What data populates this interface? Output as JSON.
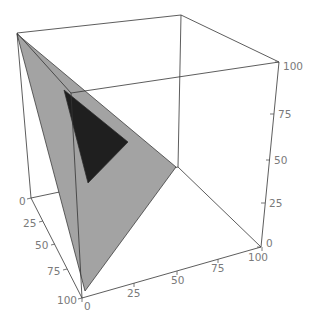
{
  "chart_data": {
    "type": "polygon3d",
    "title": "",
    "axes": {
      "left_edge": {
        "label": "",
        "ticks": [
          "0",
          "25",
          "50",
          "75",
          "100"
        ],
        "range": [
          0,
          100
        ]
      },
      "bottom_edge": {
        "label": "",
        "ticks": [
          "0",
          "25",
          "50",
          "75",
          "100"
        ],
        "range": [
          0,
          100
        ]
      },
      "vertical": {
        "label": "",
        "ticks": [
          "0",
          "25",
          "50",
          "75",
          "100"
        ],
        "range": [
          0,
          100
        ]
      }
    },
    "grid": false,
    "legend": null,
    "polygons": [
      {
        "name": "gray-plane",
        "color": "#a3a3a3",
        "vertices_data": [
          [
            0,
            0,
            100
          ],
          [
            100,
            0,
            0
          ],
          [
            0,
            100,
            0
          ]
        ],
        "vertices_screen": [
          [
            17,
            34
          ],
          [
            85,
            291
          ],
          [
            176,
            167
          ]
        ]
      },
      {
        "name": "dark-triangle",
        "color": "#1f1f1f",
        "vertices_screen": [
          [
            64,
            90
          ],
          [
            128,
            142
          ],
          [
            88,
            183
          ]
        ]
      }
    ],
    "box": {
      "back_edges": [
        [
          [
            181,
            15
          ],
          [
            178,
            167
          ]
        ],
        [
          [
            178,
            167
          ],
          [
            31,
            198
          ]
        ],
        [
          [
            178,
            167
          ],
          [
            261,
            247
          ]
        ]
      ],
      "front_edges": [
        [
          [
            17,
            33
          ],
          [
            181,
            15
          ]
        ],
        [
          [
            181,
            15
          ],
          [
            279,
            62
          ]
        ],
        [
          [
            17,
            33
          ],
          [
            31,
            198
          ]
        ],
        [
          [
            31,
            198
          ],
          [
            82,
            298
          ]
        ],
        [
          [
            82,
            298
          ],
          [
            261,
            247
          ]
        ],
        [
          [
            261,
            247
          ],
          [
            279,
            62
          ]
        ],
        [
          [
            17,
            33
          ],
          [
            71,
            93
          ]
        ],
        [
          [
            71,
            93
          ],
          [
            279,
            62
          ]
        ],
        [
          [
            71,
            93
          ],
          [
            82,
            298
          ]
        ]
      ]
    },
    "tick_marks": {
      "left_edge": [
        {
          "label": "0",
          "at": [
            31,
            198
          ],
          "dir": [
            -4,
            1
          ],
          "text_at": [
            19,
            205
          ]
        },
        {
          "label": "25",
          "at": [
            43,
            221
          ],
          "dir": [
            -4,
            1
          ],
          "text_at": [
            23,
            227
          ]
        },
        {
          "label": "50",
          "at": [
            55,
            244
          ],
          "dir": [
            -4,
            1
          ],
          "text_at": [
            35,
            249
          ]
        },
        {
          "label": "75",
          "at": [
            67,
            269
          ],
          "dir": [
            -4,
            1
          ],
          "text_at": [
            47,
            275
          ]
        },
        {
          "label": "100",
          "at": [
            82,
            298
          ],
          "dir": [
            -4,
            1
          ],
          "text_at": [
            57,
            304
          ]
        }
      ],
      "bottom_edge": [
        {
          "label": "0",
          "at": [
            82,
            298
          ],
          "dir": [
            0,
            4
          ],
          "text_at": [
            84,
            310
          ]
        },
        {
          "label": "25",
          "at": [
            134,
            283
          ],
          "dir": [
            0,
            4
          ],
          "text_at": [
            127,
            297
          ]
        },
        {
          "label": "50",
          "at": [
            177,
            271
          ],
          "dir": [
            0,
            4
          ],
          "text_at": [
            171,
            284
          ]
        },
        {
          "label": "75",
          "at": [
            218,
            259
          ],
          "dir": [
            0,
            4
          ],
          "text_at": [
            211,
            272
          ]
        },
        {
          "label": "100",
          "at": [
            262,
            247
          ],
          "dir": [
            0,
            4
          ],
          "text_at": [
            248,
            261
          ]
        }
      ],
      "vertical": [
        {
          "label": "0",
          "at": [
            261,
            247
          ],
          "dir": [
            -4,
            0
          ],
          "text_at": [
            266,
            247
          ]
        },
        {
          "label": "25",
          "at": [
            265,
            203
          ],
          "dir": [
            -4,
            0
          ],
          "text_at": [
            269,
            207
          ]
        },
        {
          "label": "50",
          "at": [
            270,
            160
          ],
          "dir": [
            -4,
            0
          ],
          "text_at": [
            274,
            164
          ]
        },
        {
          "label": "75",
          "at": [
            274,
            114
          ],
          "dir": [
            -4,
            0
          ],
          "text_at": [
            278,
            118
          ]
        },
        {
          "label": "100",
          "at": [
            279,
            62
          ],
          "dir": [
            -4,
            0
          ],
          "text_at": [
            283,
            70
          ]
        }
      ]
    }
  }
}
